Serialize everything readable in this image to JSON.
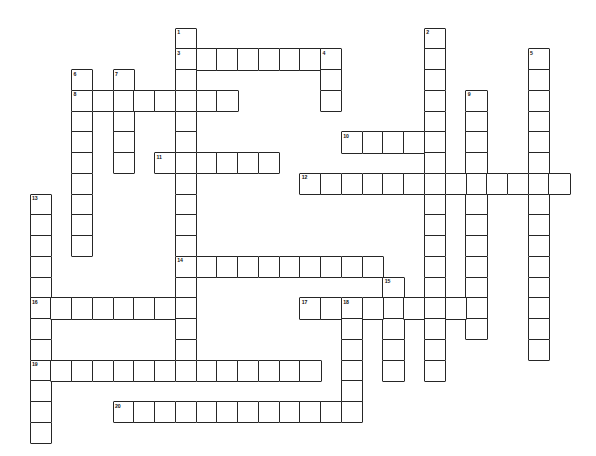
{
  "puzzle": {
    "type": "crossword-grid",
    "title": "",
    "cell_size": 20.75,
    "origin_x": 29.5,
    "origin_y": 27.5,
    "grid_cols": 28,
    "grid_rows": 21,
    "colors": {
      "background": "#ffffff",
      "cell_fill": "#ffffff",
      "cell_border": "#262626",
      "number_text": "#111111"
    },
    "entries": [
      {
        "number": 1,
        "direction": "down",
        "col": 7,
        "row": 0,
        "length": 17
      },
      {
        "number": 2,
        "direction": "down",
        "col": 19,
        "row": 0,
        "length": 17
      },
      {
        "number": 3,
        "direction": "across",
        "col": 7,
        "row": 1,
        "length": 8
      },
      {
        "number": 4,
        "direction": "down",
        "col": 14,
        "row": 1,
        "length": 3
      },
      {
        "number": 5,
        "direction": "down",
        "col": 24,
        "row": 1,
        "length": 15
      },
      {
        "number": 6,
        "direction": "down",
        "col": 2,
        "row": 2,
        "length": 9
      },
      {
        "number": 7,
        "direction": "down",
        "col": 4,
        "row": 2,
        "length": 5
      },
      {
        "number": 8,
        "direction": "across",
        "col": 2,
        "row": 3,
        "length": 8
      },
      {
        "number": 9,
        "direction": "down",
        "col": 21,
        "row": 3,
        "length": 12
      },
      {
        "number": 10,
        "direction": "across",
        "col": 15,
        "row": 5,
        "length": 5
      },
      {
        "number": 11,
        "direction": "across",
        "col": 6,
        "row": 6,
        "length": 6
      },
      {
        "number": 12,
        "direction": "across",
        "col": 13,
        "row": 7,
        "length": 13
      },
      {
        "number": 13,
        "direction": "down",
        "col": 0,
        "row": 8,
        "length": 12
      },
      {
        "number": 14,
        "direction": "across",
        "col": 7,
        "row": 11,
        "length": 10
      },
      {
        "number": 15,
        "direction": "down",
        "col": 17,
        "row": 12,
        "length": 5
      },
      {
        "number": 16,
        "direction": "across",
        "col": 0,
        "row": 13,
        "length": 8
      },
      {
        "number": 17,
        "direction": "across",
        "col": 13,
        "row": 13,
        "length": 8
      },
      {
        "number": 18,
        "direction": "down",
        "col": 15,
        "row": 13,
        "length": 6
      },
      {
        "number": 19,
        "direction": "across",
        "col": 0,
        "row": 16,
        "length": 14
      },
      {
        "number": 20,
        "direction": "across",
        "col": 4,
        "row": 18,
        "length": 11
      }
    ]
  }
}
